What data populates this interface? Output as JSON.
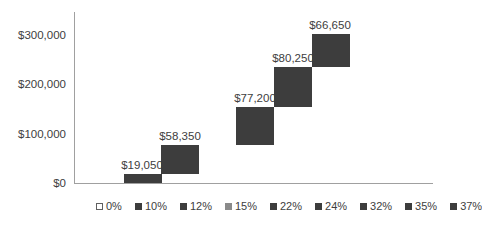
{
  "chart_data": {
    "type": "bar",
    "subtype": "waterfall-stacked",
    "title": "",
    "xlabel": "",
    "ylabel": "",
    "ylim": [
      0,
      340000
    ],
    "grid": false,
    "legend_position": "bottom",
    "yticks": [
      "$0",
      "$100,000",
      "$200,000",
      "$300,000"
    ],
    "ytick_values": [
      0,
      100000,
      200000,
      300000
    ],
    "categories": [
      "0%",
      "10%",
      "12%",
      "15%",
      "22%",
      "24%",
      "32%",
      "35%",
      "37%"
    ],
    "series": [
      {
        "name": "0%",
        "base": 0,
        "value": 0,
        "label": "",
        "color": "#ffffff"
      },
      {
        "name": "10%",
        "base": 0,
        "value": 19050,
        "label": "$19,050",
        "color": "#3d3d3d"
      },
      {
        "name": "12%",
        "base": 19050,
        "value": 58350,
        "label": "$58,350",
        "color": "#3d3d3d"
      },
      {
        "name": "15%",
        "base": 77400,
        "value": 0,
        "label": "",
        "color": "#8a8a8a"
      },
      {
        "name": "22%",
        "base": 77400,
        "value": 77200,
        "label": "$77,200",
        "color": "#3d3d3d"
      },
      {
        "name": "24%",
        "base": 154600,
        "value": 80250,
        "label": "$80,250",
        "color": "#3d3d3d"
      },
      {
        "name": "32%",
        "base": 234850,
        "value": 66650,
        "label": "$66,650",
        "color": "#3d3d3d"
      },
      {
        "name": "35%",
        "base": 301500,
        "value": 0,
        "label": "",
        "color": "#3d3d3d"
      },
      {
        "name": "37%",
        "base": 301500,
        "value": 0,
        "label": "",
        "color": "#3d3d3d"
      }
    ]
  },
  "legend": [
    {
      "label": "0%",
      "color": "#ffffff",
      "outline": true
    },
    {
      "label": "10%",
      "color": "#3d3d3d"
    },
    {
      "label": "12%",
      "color": "#3d3d3d"
    },
    {
      "label": "15%",
      "color": "#8a8a8a"
    },
    {
      "label": "22%",
      "color": "#3d3d3d"
    },
    {
      "label": "24%",
      "color": "#3d3d3d"
    },
    {
      "label": "32%",
      "color": "#3d3d3d"
    },
    {
      "label": "35%",
      "color": "#3d3d3d"
    },
    {
      "label": "37%",
      "color": "#3d3d3d"
    }
  ],
  "layout": {
    "plot_left": 74,
    "plot_baseline_y": 183,
    "px_per_unit": 0.000493,
    "slot_start_x": 86,
    "slot_width": 37.6,
    "bar_color": "#3d3d3d",
    "axis_color": "#a0a0a0"
  }
}
